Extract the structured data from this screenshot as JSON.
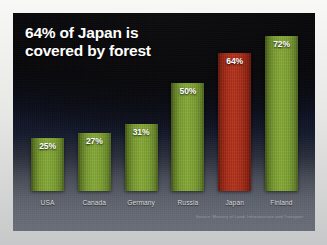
{
  "slide": {
    "title": "64% of Japan is\ncovered by forest",
    "source_note": "Source: Ministry of Land, Infrastructure and Transport",
    "background_top_color": "#050506",
    "background_bottom_color": "#6a6e78",
    "frame_color": "#efefec"
  },
  "chart_data": {
    "type": "bar",
    "title": "64% of Japan is covered by forest",
    "xlabel": "",
    "ylabel": "",
    "ylim": [
      0,
      80
    ],
    "grid": false,
    "legend": "none",
    "categories": [
      "USA",
      "Canada",
      "Germany",
      "Russia",
      "Japan",
      "Finland"
    ],
    "values": [
      25,
      27,
      31,
      50,
      64,
      72
    ],
    "value_labels": [
      "25%",
      "27%",
      "31%",
      "50%",
      "64%",
      "72%"
    ],
    "colors": [
      "#7a9c31",
      "#7a9c31",
      "#7a9c31",
      "#7a9c31",
      "#a82d18",
      "#7a9c31"
    ],
    "highlight_category": "Japan",
    "highlight_color": "#a82d18",
    "series_color": "#7a9c31",
    "annotations": [
      "Source: Ministry of Land, Infrastructure and Transport"
    ]
  },
  "bars": [
    {
      "label": "USA",
      "value_label": "25%",
      "value": 25,
      "color_key": "green"
    },
    {
      "label": "Canada",
      "value_label": "27%",
      "value": 27,
      "color_key": "green"
    },
    {
      "label": "Germany",
      "value_label": "31%",
      "value": 31,
      "color_key": "green"
    },
    {
      "label": "Russia",
      "value_label": "50%",
      "value": 50,
      "color_key": "green"
    },
    {
      "label": "Japan",
      "value_label": "64%",
      "value": 64,
      "color_key": "red"
    },
    {
      "label": "Finland",
      "value_label": "72%",
      "value": 72,
      "color_key": "green"
    }
  ]
}
